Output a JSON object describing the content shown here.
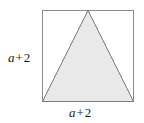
{
  "figure": {
    "background_color": "#ffffff",
    "square": {
      "name": "outer-square",
      "stroke_color": "#8c8c8c",
      "fill_color": "#ffffff",
      "stroke_width": 1,
      "x": 42,
      "y": 10,
      "width": 92,
      "height": 92
    },
    "triangle": {
      "name": "inscribed-triangle",
      "stroke_color": "#7a7a7a",
      "fill_color": "#e9e9e9",
      "stroke_width": 1,
      "points": "88,10 42,102 134,102",
      "apex": {
        "x": 88,
        "y": 10
      },
      "base_left": {
        "x": 42,
        "y": 102
      },
      "base_right": {
        "x": 134,
        "y": 102
      }
    },
    "labels": {
      "left": {
        "variable": "a",
        "operator": "+",
        "number": "2",
        "full": "a + 2"
      },
      "bottom": {
        "variable": "a",
        "operator": "+",
        "number": "2",
        "full": "a + 2"
      }
    }
  }
}
